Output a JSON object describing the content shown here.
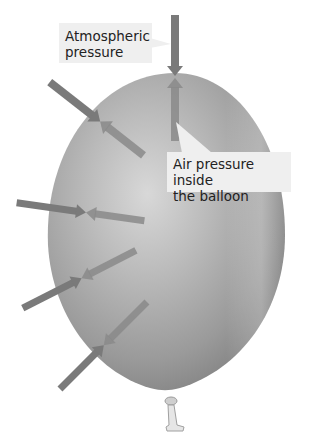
{
  "diagram": {
    "labels": {
      "atmospheric": "Atmospheric pressure",
      "atmospheric_line1": "Atmospheric",
      "atmospheric_line2": "pressure",
      "inside": "Air pressure inside the balloon",
      "inside_line1": "Air pressure inside",
      "inside_line2": "the balloon"
    },
    "elements": {
      "balloon": "inflated balloon",
      "knot": "balloon knot",
      "outside_arrows": "atmospheric pressure arrows pushing inward",
      "inside_arrows": "internal air pressure arrows pushing outward"
    },
    "arrow_pair_count": 5,
    "colors": {
      "background": "#ffffff",
      "balloon_light": "#d4d4d4",
      "balloon_dark": "#8a8a8a",
      "arrow": "#7a7a7a",
      "label_bg": "#efefef",
      "label_text": "#222222"
    }
  }
}
